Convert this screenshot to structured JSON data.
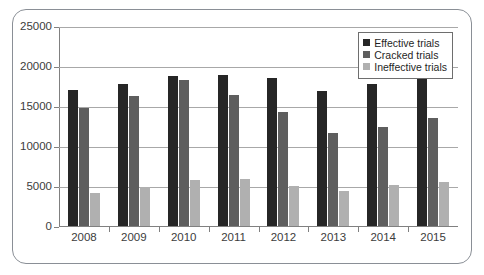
{
  "chart_data": {
    "type": "bar",
    "title": "",
    "subtitle": "",
    "xlabel": "",
    "ylabel": "",
    "categories": [
      "2008",
      "2009",
      "2010",
      "2011",
      "2012",
      "2013",
      "2014",
      "2015"
    ],
    "series": [
      {
        "name": "Effective trials",
        "color": "#262626",
        "values": [
          17000,
          17800,
          18800,
          18900,
          18500,
          16900,
          17700,
          19700
        ]
      },
      {
        "name": "Cracked trials",
        "color": "#5e5e5e",
        "values": [
          14800,
          16300,
          18300,
          16400,
          14200,
          11600,
          12400,
          13500
        ]
      },
      {
        "name": "Ineffective trials",
        "color": "#b0b0b0",
        "values": [
          4100,
          4900,
          5700,
          5900,
          5000,
          4400,
          5100,
          5500
        ]
      }
    ],
    "ylim": [
      0,
      25000
    ],
    "ytick_values": [
      0,
      5000,
      10000,
      15000,
      20000,
      25000
    ],
    "ytick_labels": [
      "0",
      "5000",
      "10000",
      "15000",
      "20000",
      "25000"
    ],
    "grid": true,
    "legend_position": "top-right",
    "gridline_color": "#a8a8a8",
    "axis_color": "#808080",
    "border_color": "#8a8f96"
  }
}
